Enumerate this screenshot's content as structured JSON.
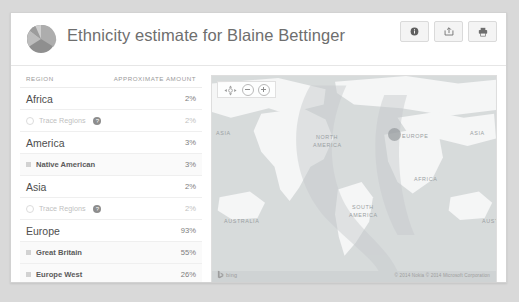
{
  "header": {
    "title": "Ethnicity estimate for Blaine Bettinger",
    "logo_icon": "pie-chart-icon",
    "buttons": [
      {
        "name": "info-button",
        "icon": "info-circle-icon",
        "label": ""
      },
      {
        "name": "share-button",
        "icon": "share-export-icon",
        "label": ""
      },
      {
        "name": "print-button",
        "icon": "printer-icon",
        "label": ""
      }
    ]
  },
  "table": {
    "columns": [
      "REGION",
      "APPROXIMATE AMOUNT"
    ],
    "rows": [
      {
        "label": "Africa",
        "amount": "2%",
        "type": "major",
        "marker": "none"
      },
      {
        "label": "Trace Regions",
        "amount": "2%",
        "type": "trace",
        "marker": "circle-outline",
        "help": "?"
      },
      {
        "label": "America",
        "amount": "3%",
        "type": "major",
        "marker": "none"
      },
      {
        "label": "Native American",
        "amount": "3%",
        "type": "sub",
        "marker": "square"
      },
      {
        "label": "Asia",
        "amount": "2%",
        "type": "major",
        "marker": "none"
      },
      {
        "label": "Trace Regions",
        "amount": "2%",
        "type": "trace",
        "marker": "circle-outline",
        "help": "?"
      },
      {
        "label": "Europe",
        "amount": "93%",
        "type": "major",
        "marker": "none"
      },
      {
        "label": "Great Britain",
        "amount": "55%",
        "type": "sub",
        "marker": "square"
      },
      {
        "label": "Europe West",
        "amount": "26%",
        "type": "sub",
        "marker": "square"
      },
      {
        "label": "Ireland",
        "amount": "7%",
        "type": "sub",
        "marker": "square"
      }
    ]
  },
  "map": {
    "provider_logo": "bing-logo",
    "provider_text": "bing",
    "copyright": "© 2014 Nokia   © 2014 Microsoft Corporation",
    "controls": {
      "compass_icon": "compass-pan-icon",
      "zoom_out_label": "−",
      "zoom_in_label": "+"
    },
    "labels": [
      {
        "text": "ASIA",
        "x": 4,
        "y": 54
      },
      {
        "text": "NORTH",
        "x": 104,
        "y": 58
      },
      {
        "text": "AMERICA",
        "x": 101,
        "y": 66
      },
      {
        "text": "EUROPE",
        "x": 190,
        "y": 57
      },
      {
        "text": "ASIA",
        "x": 258,
        "y": 54
      },
      {
        "text": "AFRICA",
        "x": 202,
        "y": 100
      },
      {
        "text": "SOUTH",
        "x": 140,
        "y": 128
      },
      {
        "text": "AMERICA",
        "x": 137,
        "y": 136
      },
      {
        "text": "AUSTRALIA",
        "x": 12,
        "y": 142
      },
      {
        "text": "AUSTRAL",
        "x": 270,
        "y": 142
      }
    ],
    "highlight_region": "Europe"
  },
  "colors": {
    "page_background": "#d9d9d9",
    "card_background": "#ffffff",
    "title_text": "#6e6e6e",
    "map_water": "#cfd3d4",
    "map_land": "#f2f3f3",
    "marker": "#8c9194"
  }
}
